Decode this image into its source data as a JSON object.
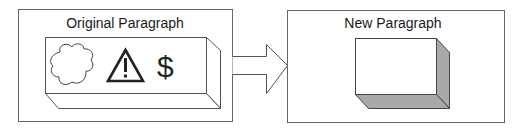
{
  "diagram": {
    "left_panel": {
      "title": "Original Paragraph",
      "box": {
        "style": "3d-box-outline",
        "icons": [
          "cloud-icon",
          "warning-triangle-icon",
          "dollar-icon"
        ],
        "dollar_glyph": "$"
      }
    },
    "arrow": {
      "direction": "right",
      "icon": "block-arrow-right"
    },
    "right_panel": {
      "title": "New Paragraph",
      "box": {
        "style": "3d-box-shaded",
        "icons": []
      }
    },
    "colors": {
      "line": "#555555",
      "shade": "#a9a9a9",
      "background": "#ffffff"
    }
  }
}
